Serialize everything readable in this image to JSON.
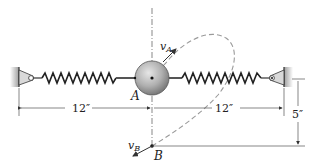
{
  "diagram": {
    "type": "spring-mass mechanics figure",
    "labels": {
      "point_a": "A",
      "point_b": "B",
      "velocity_a": "v",
      "velocity_a_sub": "A",
      "velocity_b": "v",
      "velocity_b_sub": "B"
    },
    "dimensions": {
      "left_span": "12″",
      "right_span": "12″",
      "vertical_offset": "5″"
    },
    "elements": [
      "left-wall-anchor",
      "left-spring",
      "sphere-mass",
      "right-spring",
      "right-wall-anchor",
      "dashed-elliptical-path",
      "vertical-centerline"
    ],
    "colors": {
      "line": "#333333",
      "sphere_light": "#e0e0e0",
      "sphere_dark": "#8a8a8a",
      "path": "#9a9a9a",
      "wall": "#bdbdbd"
    }
  }
}
